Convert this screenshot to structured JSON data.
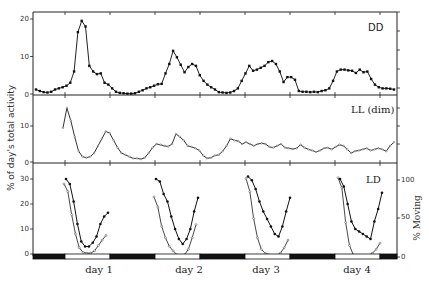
{
  "figure": {
    "y_axis_title": "% of day's total activity",
    "y_axis_title_right": "% Moving",
    "panels": [
      {
        "id": "dd",
        "label": "DD"
      },
      {
        "id": "ll",
        "label": "LL (dim)"
      },
      {
        "id": "ld",
        "label": "LD"
      }
    ],
    "day_labels": [
      "day 1",
      "day 2",
      "day 3",
      "day 4"
    ],
    "ticks": {
      "dd": [
        "20",
        "10",
        "0"
      ],
      "ll": [
        "10",
        "0"
      ],
      "ld": [
        "30",
        "20",
        "10",
        "0"
      ],
      "ld_right": [
        "100",
        "50",
        "0"
      ]
    }
  },
  "chart_data": [
    {
      "type": "line",
      "title": "DD",
      "ylabel": "% of day's total activity",
      "ylim": [
        0,
        21
      ],
      "x_unit": "hour index over 4 days (~96 h, hourly points)",
      "grid": false,
      "series": [
        {
          "name": "DD activity",
          "marker": "filled-square",
          "values": [
            1.2,
            0.8,
            0.5,
            0.4,
            0.6,
            1.2,
            1.5,
            1.8,
            2.2,
            3.0,
            6.0,
            16.5,
            19.5,
            18.0,
            7.5,
            6.0,
            5.3,
            5.5,
            3.0,
            2.5,
            1.5,
            0.6,
            0.3,
            0.2,
            0.1,
            0.1,
            0.2,
            0.6,
            1.0,
            1.5,
            1.8,
            2.2,
            2.6,
            2.7,
            5.5,
            8.0,
            11.5,
            9.8,
            7.8,
            5.8,
            7.2,
            8.0,
            7.5,
            5.0,
            3.5,
            2.5,
            1.8,
            1.2,
            0.5,
            0.4,
            0.3,
            0.4,
            0.8,
            1.5,
            3.5,
            5.5,
            7.5,
            6.2,
            6.5,
            7.0,
            7.5,
            8.5,
            8.8,
            8.0,
            6.0,
            3.2,
            4.5,
            4.5,
            3.8,
            0.8,
            0.6,
            0.6,
            0.5,
            0.6,
            0.5,
            0.8,
            1.0,
            1.5,
            3.5,
            6.0,
            6.5,
            6.5,
            6.3,
            6.2,
            5.6,
            6.5,
            5.8,
            6.0,
            4.0,
            2.5,
            1.8,
            1.5,
            1.5,
            1.4,
            1.2
          ]
        }
      ]
    },
    {
      "type": "line",
      "title": "LL (dim)",
      "ylim": [
        0,
        15
      ],
      "grid": false,
      "series": [
        {
          "name": "LL activity",
          "marker": "open-small",
          "values": [
            9.5,
            15.0,
            11.5,
            7.0,
            3.0,
            1.5,
            1.2,
            1.5,
            2.5,
            4.5,
            6.5,
            8.5,
            8.0,
            6.0,
            4.0,
            2.5,
            2.0,
            1.5,
            1.0,
            1.0,
            0.8,
            1.2,
            2.5,
            4.0,
            5.0,
            4.8,
            4.5,
            4.3,
            5.0,
            7.8,
            7.0,
            6.0,
            4.5,
            4.2,
            3.8,
            3.2,
            1.8,
            1.0,
            1.2,
            1.8,
            2.0,
            3.0,
            4.5,
            6.5,
            6.0,
            5.8,
            5.0,
            5.5,
            5.0,
            4.5,
            5.0,
            5.2,
            5.0,
            4.2,
            4.0,
            4.5,
            5.0,
            4.0,
            3.8,
            3.6,
            3.8,
            4.8,
            4.0,
            3.5,
            3.2,
            2.8,
            3.2,
            3.8,
            4.0,
            3.5,
            4.2,
            4.8,
            4.5,
            3.5,
            2.5,
            3.0,
            3.2,
            3.5,
            3.8,
            3.2,
            3.5,
            3.8,
            3.5,
            3.0,
            4.5,
            5.5
          ]
        }
      ]
    },
    {
      "type": "line",
      "title": "LD",
      "ylabel": "% of day's total activity",
      "ylabel_right": "% Moving",
      "ylim": [
        0,
        33
      ],
      "ylim_right": [
        0,
        110
      ],
      "x_categories": [
        "day 1",
        "day 2",
        "day 3",
        "day 4"
      ],
      "photoperiod_bar": "alternating dark (night) / light (day) bar along x-axis",
      "series": [
        {
          "name": "% of day's total activity (filled circles)",
          "marker": "filled-circle",
          "by_day": [
            [
              30.0,
              28.0,
              21.0,
              12.0,
              5.0,
              3.0,
              3.0,
              4.5,
              7.0,
              12.0,
              15.0,
              16.5
            ],
            [
              30.0,
              29.0,
              24.0,
              21.0,
              15.0,
              10.0,
              6.0,
              4.0,
              6.0,
              10.0,
              17.0,
              22.5
            ],
            [
              31.0,
              29.5,
              26.0,
              21.0,
              17.0,
              14.0,
              11.0,
              8.0,
              7.0,
              11.0,
              17.0,
              22.5
            ],
            [
              30.0,
              27.0,
              20.0,
              13.0,
              10.0,
              9.0,
              8.0,
              7.0,
              6.0,
              13.0,
              18.0,
              24.5
            ]
          ]
        },
        {
          "name": "% Moving (open circles)",
          "marker": "open-circle",
          "by_day": [
            [
              95,
              85,
              55,
              30,
              12,
              6,
              5,
              5,
              8,
              15,
              22,
              28
            ],
            [
              78,
              65,
              40,
              25,
              14,
              8,
              3,
              1,
              3,
              10,
              25,
              42
            ],
            [
              102,
              85,
              50,
              25,
              10,
              5,
              3,
              2,
              2,
              5,
              12,
              22
            ],
            [
              103,
              90,
              45,
              15,
              3,
              1,
              1,
              1,
              2,
              5,
              10,
              18
            ]
          ]
        }
      ]
    }
  ]
}
